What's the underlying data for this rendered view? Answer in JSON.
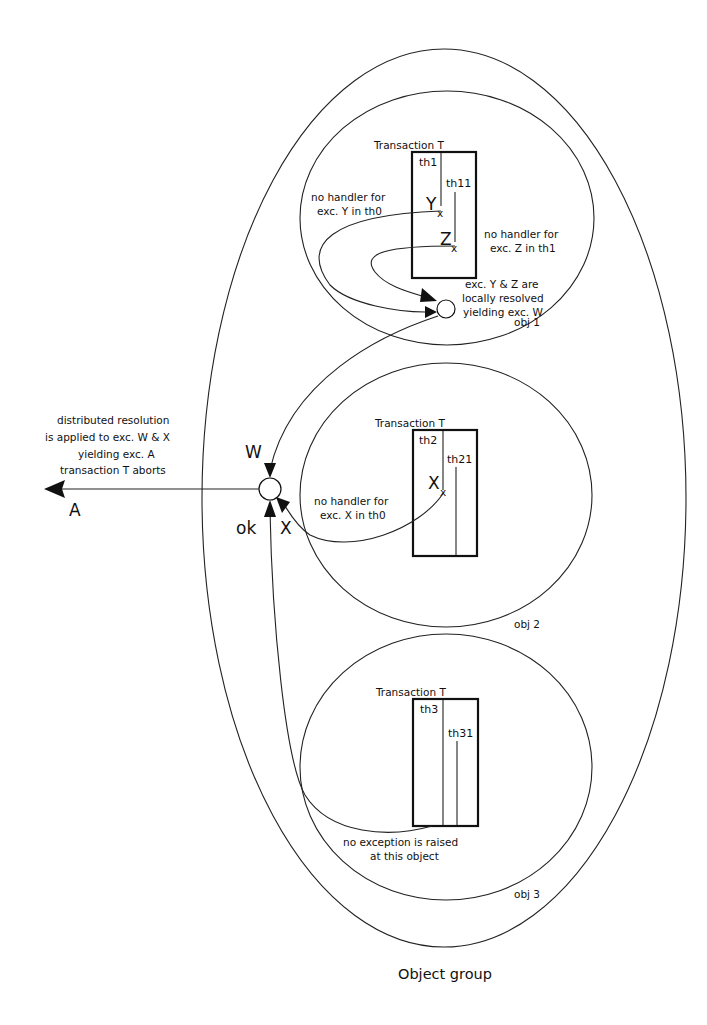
{
  "diagram": {
    "group_label": "Object group",
    "objects": [
      {
        "label": "obj 1",
        "transaction_label": "Transaction T",
        "threads": [
          "th1",
          "th11"
        ],
        "exceptions": [
          "Y",
          "Z"
        ],
        "notes": {
          "left": [
            "no handler for",
            "exc. Y in th0"
          ],
          "right": [
            "no handler for",
            "exc. Z in th1"
          ],
          "resolution": [
            "exc. Y & Z  are",
            "locally resolved",
            "yielding exc. W"
          ]
        }
      },
      {
        "label": "obj 2",
        "transaction_label": "Transaction T",
        "threads": [
          "th2",
          "th21"
        ],
        "exceptions": [
          "X"
        ],
        "notes": {
          "left": [
            "no handler for",
            "exc. X in th0"
          ]
        }
      },
      {
        "label": "obj 3",
        "transaction_label": "Transaction T",
        "threads": [
          "th3",
          "th31"
        ],
        "exceptions": [],
        "notes": {
          "bottom": [
            "no exception is raised",
            "at this object"
          ]
        }
      }
    ],
    "central_node": {
      "inputs": [
        "W",
        "X",
        "ok"
      ],
      "output": "A",
      "note": [
        "distributed resolution",
        "is applied to exc. W & X",
        "yielding exc. A",
        "transaction T aborts"
      ]
    },
    "colors": {
      "stroke": "#222222",
      "background": "#ffffff"
    }
  }
}
